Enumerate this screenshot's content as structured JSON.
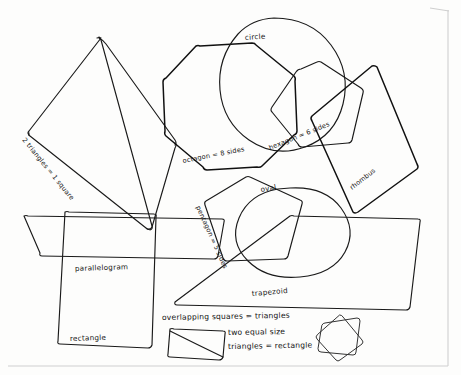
{
  "page": {
    "background_color": "#fdfdfc",
    "ink_color": "#1a1a1a",
    "border_color": "#cfcfcf"
  },
  "labels": {
    "two_triangles": "2 triangles = 1 square",
    "octagon": "octagon = 8 sides",
    "hexagon": "hexagon = 6 sides",
    "pentagon": "pentagon = 5 sides",
    "circle": "circle",
    "oval": "oval",
    "rhombus": "rhombus",
    "parallelogram": "parallelogram",
    "rectangle": "rectangle",
    "trapezoid": "trapezoid"
  },
  "notes": {
    "overlapping_squares": "overlapping squares = triangles",
    "two_equal_size": "two equal size",
    "triangles_rectangle": "triangles = rectangle"
  },
  "shapes": [
    {
      "name": "square-rotated-two-triangles",
      "label": "2 triangles = 1 square",
      "sides": 4
    },
    {
      "name": "octagon",
      "label": "octagon = 8 sides",
      "sides": 8
    },
    {
      "name": "hexagon",
      "label": "hexagon = 6 sides",
      "sides": 6
    },
    {
      "name": "pentagon",
      "label": "pentagon = 5 sides",
      "sides": 5
    },
    {
      "name": "circle",
      "label": "circle",
      "sides": 0
    },
    {
      "name": "oval",
      "label": "oval",
      "sides": 0
    },
    {
      "name": "rhombus",
      "label": "rhombus",
      "sides": 4
    },
    {
      "name": "parallelogram",
      "label": "parallelogram",
      "sides": 4
    },
    {
      "name": "rectangle",
      "label": "rectangle",
      "sides": 4
    },
    {
      "name": "trapezoid",
      "label": "trapezoid",
      "sides": 4
    },
    {
      "name": "rectangle-with-diagonal",
      "label": "two equal size triangles = rectangle",
      "sides": 4
    },
    {
      "name": "overlapping-squares-star",
      "label": "overlapping squares = triangles",
      "sides": 8
    }
  ]
}
